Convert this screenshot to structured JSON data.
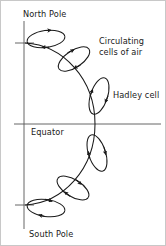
{
  "figure": {
    "background_color": "#ffffff",
    "stroke_color": "#1a1a1a",
    "axis_color": "#555555",
    "labels": {
      "north_pole": "North Pole",
      "south_pole": "South Pole",
      "equator": "Equator",
      "hadley_cell": "Hadley cell",
      "circulating_line1": "Circulating",
      "circulating_line2": "cells of air"
    },
    "axes": {
      "polar_axis_label": "polar-axis-line",
      "equator_line_label": "equator-line",
      "north_latitude_line_label": "north-latitude-line",
      "south_latitude_line_label": "south-latitude-line"
    },
    "cells": [
      {
        "id": "cell-north-polar",
        "hemisphere": "north",
        "index": 1,
        "rotation_deg": -8,
        "cx": 45,
        "cy": 38,
        "rx": 19,
        "ry": 8.5,
        "flow": "clockwise"
      },
      {
        "id": "cell-north-ferrel",
        "hemisphere": "north",
        "index": 2,
        "rotation_deg": -34,
        "cx": 73,
        "cy": 58,
        "rx": 18,
        "ry": 8.5,
        "flow": "clockwise"
      },
      {
        "id": "cell-north-hadley",
        "hemisphere": "north",
        "index": 3,
        "rotation_deg": -72,
        "cx": 98,
        "cy": 95,
        "rx": 19,
        "ry": 8.5,
        "flow": "clockwise"
      },
      {
        "id": "cell-south-hadley",
        "hemisphere": "south",
        "index": 4,
        "rotation_deg": -108,
        "cx": 96,
        "cy": 152,
        "rx": 19,
        "ry": 8.5,
        "flow": "clockwise"
      },
      {
        "id": "cell-south-ferrel",
        "hemisphere": "south",
        "index": 5,
        "rotation_deg": -148,
        "cx": 72,
        "cy": 187,
        "rx": 18,
        "ry": 8.5,
        "flow": "clockwise"
      },
      {
        "id": "cell-south-polar",
        "hemisphere": "south",
        "index": 6,
        "rotation_deg": -172,
        "cx": 45,
        "cy": 207,
        "rx": 19,
        "ry": 8.5,
        "flow": "clockwise"
      }
    ],
    "earth_arc": {
      "id": "earth-limb-arc",
      "path": "M 24 42 C 62 44, 94 78, 94 123 C 94 168, 62 202, 24 204"
    }
  }
}
